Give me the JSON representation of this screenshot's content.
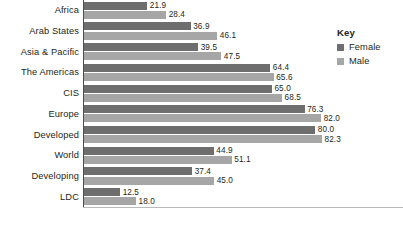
{
  "chart_data": {
    "type": "bar",
    "orientation": "horizontal",
    "title": "",
    "xlabel": "",
    "ylabel": "",
    "xlim": [
      0,
      82.3
    ],
    "grid": false,
    "legend_position": "right",
    "categories": [
      "Africa",
      "Arab States",
      "Asia & Pacific",
      "The Americas",
      "CIS",
      "Europe",
      "Developed",
      "World",
      "Developing",
      "LDC"
    ],
    "series": [
      {
        "name": "Female",
        "color": "#6e6e6e",
        "values": [
          21.9,
          36.9,
          39.5,
          64.4,
          65.0,
          76.3,
          80.0,
          44.9,
          37.4,
          12.5
        ]
      },
      {
        "name": "Male",
        "color": "#a6a6a6",
        "values": [
          28.4,
          46.1,
          47.5,
          65.6,
          68.5,
          82.0,
          82.3,
          51.1,
          45.0,
          18.0
        ]
      }
    ],
    "value_labels": [
      [
        "21.9",
        "28.4"
      ],
      [
        "36.9",
        "46.1"
      ],
      [
        "39.5",
        "47.5"
      ],
      [
        "64.4",
        "65.6"
      ],
      [
        "65.0",
        "68.5"
      ],
      [
        "76.3",
        "82.0"
      ],
      [
        "80.0",
        "82.3"
      ],
      [
        "44.9",
        "51.1"
      ],
      [
        "37.4",
        "45.0"
      ],
      [
        "12.5",
        "18.0"
      ]
    ]
  },
  "legend": {
    "title": "Key",
    "items": [
      {
        "label": "Female",
        "color": "#6e6e6e"
      },
      {
        "label": "Male",
        "color": "#a6a6a6"
      }
    ]
  },
  "axis": {
    "line_color": "#4d4d4d",
    "baseline_color": "#b9b9b9"
  }
}
